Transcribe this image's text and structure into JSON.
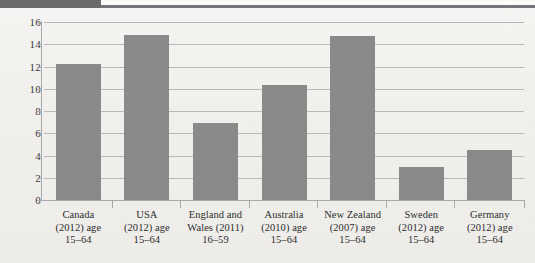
{
  "page": {
    "background_color": "#f1f0ed",
    "header_block_color": "#6b6b6b",
    "header_rule_color": "#76767a"
  },
  "chart_data": {
    "type": "bar",
    "title": "",
    "subtitle": "",
    "xlabel": "",
    "ylabel": "",
    "ylim": [
      0,
      16
    ],
    "ytick_step": 2,
    "yticks": [
      "0",
      "2",
      "4",
      "6",
      "8",
      "10",
      "12",
      "14",
      "16"
    ],
    "grid": true,
    "legend": false,
    "bar_color": "#8a8a8a",
    "axis_color": "#a9a9a9",
    "gridline_color": "#b9b9b9",
    "categories": [
      "Canada (2012) age 15–64",
      "USA (2012) age 15–64",
      "England and Wales (2011) 16–59",
      "Australia (2010) age 15–64",
      "New Zealand (2007) age 15–64",
      "Sweden (2012) age 15–64",
      "Germany (2012) age 15–64"
    ],
    "category_lines": [
      [
        "Canada",
        "(2012) age",
        "15–64"
      ],
      [
        "USA",
        "(2012) age",
        "15–64"
      ],
      [
        "England and",
        "Wales (2011)",
        "16–59"
      ],
      [
        "Australia",
        "(2010) age",
        "15–64"
      ],
      [
        "New Zealand",
        "(2007) age",
        "15–64"
      ],
      [
        "Sweden",
        "(2012) age",
        "15–64"
      ],
      [
        "Germany",
        "(2012) age",
        "15–64"
      ]
    ],
    "values": [
      12.2,
      14.8,
      6.9,
      10.3,
      14.7,
      3.0,
      4.5
    ]
  }
}
